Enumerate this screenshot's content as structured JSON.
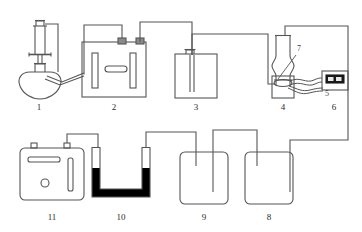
{
  "figure": {
    "width": 362,
    "height": 232,
    "background_color": "#ffffff",
    "line_color": "#555555",
    "dark_fill_color": "#000000",
    "label_color": "#2b2b2b"
  },
  "labels": {
    "item1": "1",
    "item2": "2",
    "item3": "3",
    "item4": "4",
    "item5": "5",
    "item6": "6",
    "item7": "7",
    "item8": "8",
    "item9": "9",
    "item10": "10",
    "item11": "11"
  },
  "components": [
    {
      "id": "1",
      "name": "round-bottom-flask-with-dropping-funnel",
      "row": "top",
      "description": "Round bottom flask fitted with a dropping funnel having a stopcock and a side arm outlet"
    },
    {
      "id": "2",
      "name": "electrolysis-cell",
      "row": "top",
      "description": "Rectangular vessel containing two vertical electrode plates and a horizontal element, with two terminal stoppers on top"
    },
    {
      "id": "3",
      "name": "gas-washing-bottle",
      "row": "top",
      "description": "Rectangular bottle with small neck stopper and a long inlet tube reaching toward the bottom"
    },
    {
      "id": "4",
      "name": "vertical-reaction-tube",
      "row": "top",
      "description": "Vertical tube with a central bulge mounted on a support stand"
    },
    {
      "id": "5",
      "name": "flexible-tubing-connector",
      "row": "top",
      "description": "Wavy flexible tubing linking the reaction tube to the meter"
    },
    {
      "id": "6",
      "name": "digital-meter",
      "row": "top",
      "description": "Small instrument box with a dark two-segment display"
    },
    {
      "id": "7",
      "name": "reaction-tube-pointer",
      "row": "top",
      "description": "Leader line pointing at the bulge region inside the reaction tube"
    },
    {
      "id": "8",
      "name": "gas-washing-bottle-8",
      "row": "bottom",
      "description": "Rounded rectangular bottle with a short inlet tube and a long tube"
    },
    {
      "id": "9",
      "name": "gas-washing-bottle-9",
      "row": "bottom",
      "description": "Rounded rectangular bottle with a short inlet tube and a long tube"
    },
    {
      "id": "10",
      "name": "u-tube-with-solid",
      "row": "bottom",
      "description": "U shaped tube packed with a dark solid, open at both arm tops"
    },
    {
      "id": "11",
      "name": "instrument-box",
      "row": "bottom",
      "description": "Rounded box with two top terminals, a horizontal slot, a vertical slot and a small round port"
    }
  ]
}
